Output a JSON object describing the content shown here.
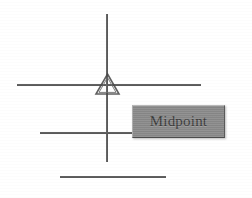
{
  "canvas": {
    "width": 252,
    "height": 198,
    "background_color": "#ffffff"
  },
  "tooltip": {
    "label": "Midpoint",
    "background_color": "#8a8a8a",
    "text_color": "#3a3a3a",
    "border_light_color": "#b9b9b9",
    "border_dark_color": "#4d4d4d"
  },
  "marker": {
    "name": "midpoint-triangle-marker",
    "shape": "triangle",
    "stroke_color": "#4a4a4a"
  },
  "geometry": {
    "line_color": "#4e4e4e",
    "lines": [
      {
        "name": "crosshair-horizontal-line",
        "orientation": "horizontal"
      },
      {
        "name": "crosshair-vertical-line",
        "orientation": "vertical"
      },
      {
        "name": "object-line-middle",
        "orientation": "horizontal"
      },
      {
        "name": "object-line-bottom",
        "orientation": "horizontal"
      }
    ]
  }
}
